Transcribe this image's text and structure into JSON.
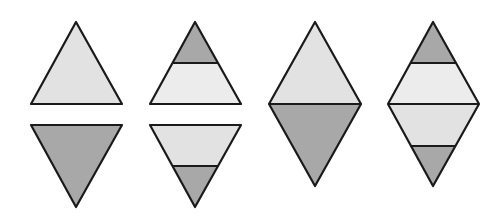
{
  "colors": {
    "light": "#e2e2e2",
    "lighter": "#ececec",
    "dark": "#a8a8a8",
    "stroke": "#1a1a1a",
    "background": "#ffffff"
  },
  "figures": [
    {
      "name": "upright-triangle-light",
      "description": "Upright triangle, fully light"
    },
    {
      "name": "inverted-triangle-dark",
      "description": "Inverted triangle, fully dark"
    },
    {
      "name": "upright-triangle-striped",
      "description": "Upright triangle, dark tip over light band"
    },
    {
      "name": "inverted-triangle-striped",
      "description": "Inverted triangle, light band over dark tip"
    },
    {
      "name": "diamond-two-tone",
      "description": "Diamond: light top half, dark bottom half"
    },
    {
      "name": "diamond-striped",
      "description": "Diamond: dark tip, light bands, dark tip"
    }
  ]
}
